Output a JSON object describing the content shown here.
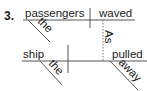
{
  "diagram": {
    "type": "sentence-diagram",
    "item_number": "3.",
    "main_clause": {
      "subject": "passengers",
      "verb": "waved",
      "modifiers": [
        {
          "word": "the",
          "modifies": "passengers"
        }
      ]
    },
    "subordinate_clause": {
      "conjunction": "As",
      "subject": "ship",
      "verb": "pulled",
      "modifiers": [
        {
          "word": "the",
          "modifies": "ship"
        },
        {
          "word": "away",
          "modifies": "pulled"
        }
      ]
    },
    "colors": {
      "text": "#1a1a1a",
      "lines": "#555555",
      "dotted": "#777777"
    }
  }
}
